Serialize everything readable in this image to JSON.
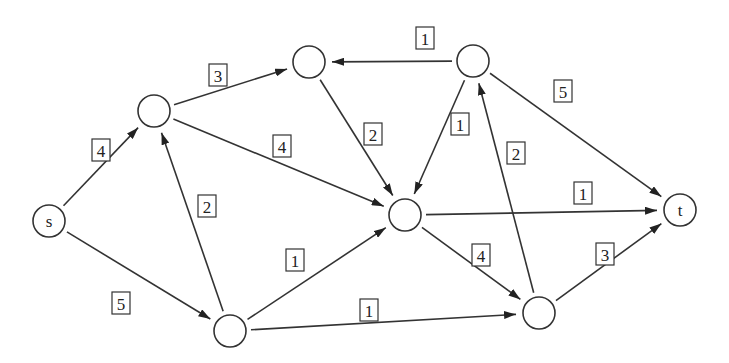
{
  "diagram": {
    "type": "directed flow network",
    "nodes": [
      {
        "id": "s",
        "label": "s",
        "x": 49,
        "y": 221
      },
      {
        "id": "a",
        "label": "",
        "x": 154,
        "y": 111
      },
      {
        "id": "b",
        "label": "",
        "x": 309,
        "y": 62
      },
      {
        "id": "c",
        "label": "",
        "x": 473,
        "y": 61
      },
      {
        "id": "d",
        "label": "",
        "x": 405,
        "y": 215
      },
      {
        "id": "e",
        "label": "",
        "x": 230,
        "y": 331
      },
      {
        "id": "f",
        "label": "",
        "x": 539,
        "y": 313
      },
      {
        "id": "t",
        "label": "t",
        "x": 680,
        "y": 210
      }
    ],
    "edges": [
      {
        "from": "s",
        "to": "a",
        "capacity": "4",
        "lx": 101,
        "ly": 150
      },
      {
        "from": "s",
        "to": "e",
        "capacity": "5",
        "lx": 121,
        "ly": 303
      },
      {
        "from": "a",
        "to": "b",
        "capacity": "3",
        "lx": 218,
        "ly": 75
      },
      {
        "from": "a",
        "to": "d",
        "capacity": "4",
        "lx": 282,
        "ly": 146
      },
      {
        "from": "e",
        "to": "a",
        "capacity": "2",
        "lx": 207,
        "ly": 206
      },
      {
        "from": "b",
        "to": "d",
        "capacity": "2",
        "lx": 373,
        "ly": 134
      },
      {
        "from": "c",
        "to": "b",
        "capacity": "1",
        "lx": 425,
        "ly": 38
      },
      {
        "from": "c",
        "to": "d",
        "capacity": "1",
        "lx": 460,
        "ly": 124
      },
      {
        "from": "c",
        "to": "t",
        "capacity": "5",
        "lx": 563,
        "ly": 91
      },
      {
        "from": "e",
        "to": "d",
        "capacity": "1",
        "lx": 295,
        "ly": 260
      },
      {
        "from": "e",
        "to": "f",
        "capacity": "1",
        "lx": 369,
        "ly": 310
      },
      {
        "from": "d",
        "to": "t",
        "capacity": "1",
        "lx": 583,
        "ly": 193
      },
      {
        "from": "d",
        "to": "f",
        "capacity": "4",
        "lx": 481,
        "ly": 255
      },
      {
        "from": "f",
        "to": "c",
        "capacity": "2",
        "lx": 516,
        "ly": 153
      },
      {
        "from": "f",
        "to": "t",
        "capacity": "3",
        "lx": 605,
        "ly": 254
      }
    ]
  }
}
